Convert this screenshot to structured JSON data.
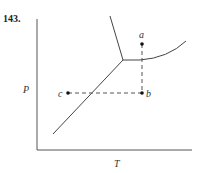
{
  "problem_number": "143.",
  "diagram": {
    "type": "phase-diagram",
    "axes": {
      "x_label": "T",
      "y_label": "P"
    },
    "points": [
      {
        "label": "a"
      },
      {
        "label": "b"
      },
      {
        "label": "c"
      }
    ],
    "colors": {
      "line": "#444444",
      "background": "#ffffff"
    }
  }
}
